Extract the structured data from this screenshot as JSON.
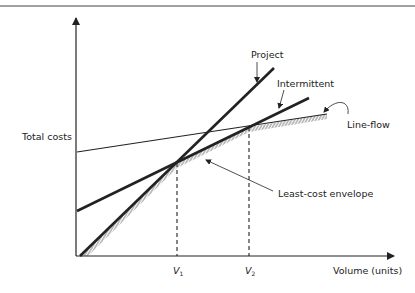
{
  "diagram": {
    "type": "cost-volume diagram",
    "y_axis_label": "Total costs",
    "x_axis_label": "Volume (units)",
    "x_markers": [
      {
        "symbol": "V",
        "subscript": "1"
      },
      {
        "symbol": "V",
        "subscript": "2"
      }
    ],
    "lines": [
      {
        "name": "Project",
        "label": "Project",
        "style": "thick"
      },
      {
        "name": "Intermittent",
        "label": "Intermittent",
        "style": "thick"
      },
      {
        "name": "Line-flow",
        "label": "Line-flow",
        "style": "thin"
      }
    ],
    "envelope_label": "Least-cost envelope",
    "colors": {
      "ink": "#222222",
      "background": "#ffffff"
    }
  }
}
